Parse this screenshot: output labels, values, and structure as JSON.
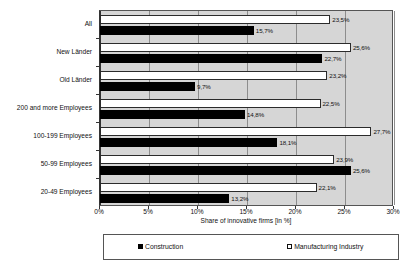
{
  "chart_data": {
    "type": "bar",
    "orientation": "horizontal",
    "title": "",
    "xlabel": "Share of innovative firms [in %]",
    "ylabel": "",
    "xlim": [
      0,
      30
    ],
    "xticks": [
      "0%",
      "5%",
      "10%",
      "15%",
      "20%",
      "25%",
      "30%"
    ],
    "xtick_values": [
      0,
      5,
      10,
      15,
      20,
      25,
      30
    ],
    "grid": true,
    "grid_axis": "x",
    "legend_position": "bottom",
    "categories": [
      "All",
      "New Länder",
      "Old Länder",
      "200 and more Employees",
      "100-199 Employees",
      "50-99 Employees",
      "20-49 Employees"
    ],
    "series": [
      {
        "name": "Manufacturing Industry",
        "color": "#ffffff",
        "edge_color": "#2b2b2b",
        "values": [
          23.5,
          25.6,
          23.2,
          22.5,
          27.7,
          23.9,
          22.1
        ],
        "labels": [
          "23,5%",
          "25,6%",
          "23,2%",
          "22,5%",
          "27,7%",
          "23,9%",
          "22,1%"
        ]
      },
      {
        "name": "Construction",
        "color": "#000000",
        "edge_color": "#000000",
        "values": [
          15.7,
          22.7,
          9.7,
          14.8,
          18.1,
          25.6,
          13.2
        ],
        "labels": [
          "15,7%",
          "22,7%",
          "9,7%",
          "14,8%",
          "18,1%",
          "25,6%",
          "13,2%"
        ]
      }
    ]
  },
  "legend": {
    "construction_label": "Construction",
    "manufacturing_label": "Manufacturing Industry"
  },
  "colors": {
    "plot_background": "#d6d6d6",
    "gridline": "#8d8d8d",
    "axis": "#333333",
    "construction": "#000000",
    "manufacturing": "#ffffff"
  }
}
